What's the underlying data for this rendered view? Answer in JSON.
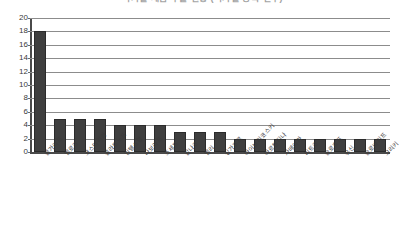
{
  "chart_data": {
    "type": "bar",
    "title": "국가별 제품 수출 현황 (국가별 등록 건수)",
    "xlabel": "",
    "ylabel": "",
    "ylim": [
      0,
      20
    ],
    "ytick_step": 2,
    "yticks": [
      "20",
      "18",
      "16",
      "14",
      "12",
      "10",
      "8",
      "6",
      "4",
      "2",
      "0"
    ],
    "grid": true,
    "legend": "none",
    "bar_color": "#3f3f3f",
    "gridline_color": "#8c8c8c",
    "axis_color": "#4a4a4a",
    "categories": [
      "불가리프",
      "벨로크",
      "코스터리카",
      "홀라토노프",
      "인텔스함",
      "나보라프",
      "조세프",
      "갈나코",
      "벨리",
      "싱가포르",
      "아이보리코스키",
      "아르헨티나",
      "자메이카",
      "비트코",
      "슬로흐프",
      "유신",
      "슬로바키프",
      "그리키"
    ],
    "values": [
      18,
      5,
      5,
      5,
      4,
      4,
      4,
      3,
      3,
      3,
      2,
      2,
      2,
      2,
      2,
      2,
      2,
      2
    ]
  }
}
